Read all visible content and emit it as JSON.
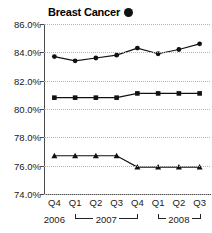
{
  "chart_data": {
    "type": "line",
    "title": "Breast Cancer",
    "title_marker": "filled-circle",
    "xlabel": "",
    "ylabel": "",
    "ylim": [
      74.0,
      86.0
    ],
    "ytick_step": 2.0,
    "ytick_labels": [
      "86.0%",
      "84.0%",
      "82.0%",
      "80.0%",
      "78.0%",
      "76.0%",
      "74.0%"
    ],
    "ytick_values": [
      86.0,
      84.0,
      82.0,
      80.0,
      78.0,
      76.0,
      74.0
    ],
    "grid": true,
    "legend": "none",
    "categories": [
      "Q4",
      "Q1",
      "Q2",
      "Q3",
      "Q4",
      "Q1",
      "Q2",
      "Q3"
    ],
    "year_groups": [
      {
        "label": "2006",
        "start": 0,
        "end": 0,
        "bracket": false
      },
      {
        "label": "2007",
        "start": 1,
        "end": 4,
        "bracket": true
      },
      {
        "label": "2008",
        "start": 5,
        "end": 7,
        "bracket": true
      }
    ],
    "series": [
      {
        "name": "Series 1",
        "marker": "diamond",
        "values": [
          83.7,
          83.4,
          83.6,
          83.8,
          84.3,
          83.9,
          84.2,
          84.6
        ]
      },
      {
        "name": "Series 2",
        "marker": "square",
        "values": [
          80.8,
          80.8,
          80.8,
          80.8,
          81.1,
          81.1,
          81.1,
          81.1
        ]
      },
      {
        "name": "Series 3",
        "marker": "triangle",
        "values": [
          76.7,
          76.7,
          76.7,
          76.7,
          75.9,
          75.9,
          75.9,
          75.9
        ]
      }
    ]
  },
  "colors": {
    "line": "#111111",
    "marker": "#111111",
    "grid": "#b5b5b5",
    "axis": "#4a4a4a",
    "text": "#1a1a1a",
    "background": "#ffffff"
  }
}
